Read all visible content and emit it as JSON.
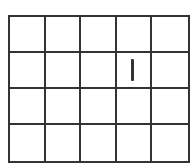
{
  "board": {
    "columns": 5,
    "rows": 4,
    "line_color": "#333333",
    "background": "#ffffff",
    "cells": [
      [
        "",
        "",
        "",
        "",
        ""
      ],
      [
        "",
        "",
        "",
        "I",
        ""
      ],
      [
        "",
        "",
        "",
        "",
        ""
      ],
      [
        "",
        "",
        "",
        "",
        ""
      ]
    ],
    "marks": [
      {
        "row": 2,
        "col": 4,
        "symbol": "vertical-bar"
      }
    ]
  }
}
